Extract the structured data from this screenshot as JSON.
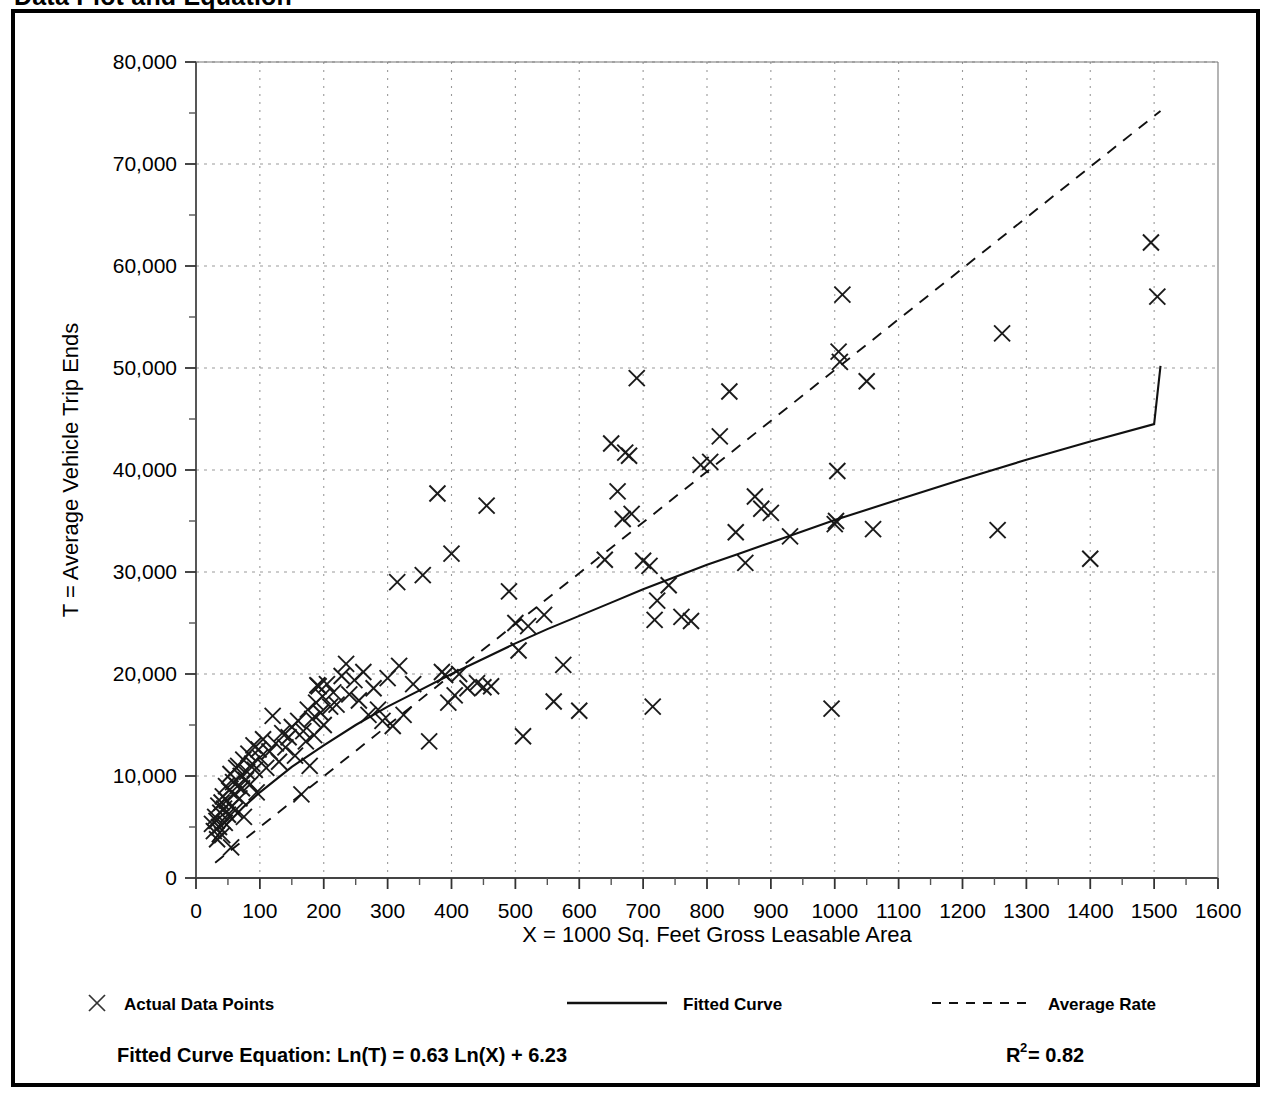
{
  "page": {
    "title": "Data Plot and Equation",
    "frame_color": "#000000",
    "background": "#ffffff"
  },
  "legend": {
    "position": "below-axis",
    "entries": [
      {
        "label": "Actual Data Points",
        "marker": "x-marker-icon",
        "style": "marker"
      },
      {
        "label": "Fitted Curve",
        "marker": "solid-line-icon",
        "style": "solid"
      },
      {
        "label": "Average Rate",
        "marker": "dashed-line-icon",
        "style": "dashed"
      }
    ]
  },
  "equation": {
    "fitted_label": "Fitted Curve Equation:  Ln(T) = 0.63 Ln(X) + 6.23",
    "r2_base": "R",
    "r2_sup": "2",
    "r2_value": " = 0.82"
  },
  "chart_data": {
    "type": "scatter",
    "title": "Data Plot and Equation",
    "xlabel": "X = 1000 Sq. Feet Gross Leasable Area",
    "ylabel": "T = Average Vehicle Trip Ends",
    "xlim": [
      0,
      1600
    ],
    "ylim": [
      0,
      80000
    ],
    "xticks": [
      0,
      100,
      200,
      300,
      400,
      500,
      600,
      700,
      800,
      900,
      1000,
      1100,
      1200,
      1300,
      1400,
      1500,
      1600
    ],
    "xticklabels": [
      "0",
      "100",
      "200",
      "300",
      "400",
      "500",
      "600",
      "700",
      "800",
      "900",
      "1000",
      "1100",
      "1200",
      "1300",
      "1400",
      "1500",
      "1600"
    ],
    "xminor_step": 50,
    "yticks": [
      0,
      10000,
      20000,
      30000,
      40000,
      50000,
      60000,
      70000,
      80000
    ],
    "yticklabels": [
      "0",
      "10,000",
      "20,000",
      "30,000",
      "40,000",
      "50,000",
      "60,000",
      "70,000",
      "80,000"
    ],
    "yminor_step": 5000,
    "grid": true,
    "grid_style": "dotted",
    "grid_color": "#999999",
    "axis_color": "#555555",
    "marker": "x",
    "marker_color": "#1a1a1a",
    "legend_position": "bottom",
    "series": [
      {
        "name": "Actual Data Points",
        "type": "scatter",
        "points": [
          [
            25,
            5300
          ],
          [
            28,
            4600
          ],
          [
            30,
            6000
          ],
          [
            32,
            5600
          ],
          [
            33,
            3800
          ],
          [
            35,
            7100
          ],
          [
            36,
            5000
          ],
          [
            38,
            6400
          ],
          [
            40,
            7400
          ],
          [
            41,
            4200
          ],
          [
            42,
            8000
          ],
          [
            44,
            6800
          ],
          [
            45,
            5400
          ],
          [
            47,
            9000
          ],
          [
            48,
            7600
          ],
          [
            50,
            6200
          ],
          [
            52,
            8600
          ],
          [
            54,
            10200
          ],
          [
            55,
            3000
          ],
          [
            56,
            7000
          ],
          [
            58,
            9400
          ],
          [
            60,
            8200
          ],
          [
            61,
            6600
          ],
          [
            63,
            10800
          ],
          [
            65,
            9000
          ],
          [
            66,
            11000
          ],
          [
            68,
            7800
          ],
          [
            70,
            10000
          ],
          [
            72,
            8800
          ],
          [
            74,
            11600
          ],
          [
            75,
            6000
          ],
          [
            78,
            9600
          ],
          [
            80,
            10400
          ],
          [
            82,
            12200
          ],
          [
            85,
            9200
          ],
          [
            88,
            11200
          ],
          [
            90,
            13000
          ],
          [
            92,
            10600
          ],
          [
            95,
            8400
          ],
          [
            98,
            12600
          ],
          [
            100,
            11800
          ],
          [
            105,
            13600
          ],
          [
            110,
            10800
          ],
          [
            115,
            12400
          ],
          [
            120,
            15900
          ],
          [
            125,
            13200
          ],
          [
            130,
            11400
          ],
          [
            135,
            14200
          ],
          [
            140,
            12800
          ],
          [
            145,
            13800
          ],
          [
            150,
            14800
          ],
          [
            155,
            12000
          ],
          [
            160,
            15400
          ],
          [
            165,
            8200
          ],
          [
            168,
            14400
          ],
          [
            172,
            13400
          ],
          [
            175,
            16500
          ],
          [
            178,
            11000
          ],
          [
            182,
            15600
          ],
          [
            185,
            14000
          ],
          [
            188,
            17200
          ],
          [
            190,
            18900
          ],
          [
            192,
            18800
          ],
          [
            195,
            16200
          ],
          [
            198,
            17800
          ],
          [
            200,
            15000
          ],
          [
            205,
            19000
          ],
          [
            210,
            16800
          ],
          [
            215,
            18200
          ],
          [
            220,
            17000
          ],
          [
            228,
            19800
          ],
          [
            235,
            21000
          ],
          [
            240,
            18000
          ],
          [
            248,
            19400
          ],
          [
            255,
            17400
          ],
          [
            262,
            20200
          ],
          [
            270,
            16000
          ],
          [
            278,
            18600
          ],
          [
            285,
            16500
          ],
          [
            292,
            15400
          ],
          [
            300,
            19600
          ],
          [
            308,
            14900
          ],
          [
            315,
            29000
          ],
          [
            318,
            20800
          ],
          [
            325,
            16000
          ],
          [
            340,
            19000
          ],
          [
            355,
            29700
          ],
          [
            365,
            13400
          ],
          [
            378,
            37700
          ],
          [
            385,
            20200
          ],
          [
            390,
            19900
          ],
          [
            395,
            17200
          ],
          [
            400,
            31800
          ],
          [
            405,
            17900
          ],
          [
            412,
            20000
          ],
          [
            425,
            18600
          ],
          [
            440,
            19100
          ],
          [
            450,
            18700
          ],
          [
            455,
            36500
          ],
          [
            462,
            18800
          ],
          [
            490,
            28100
          ],
          [
            500,
            25000
          ],
          [
            505,
            22300
          ],
          [
            512,
            13900
          ],
          [
            520,
            24700
          ],
          [
            545,
            25800
          ],
          [
            560,
            17300
          ],
          [
            575,
            20900
          ],
          [
            600,
            16400
          ],
          [
            640,
            31200
          ],
          [
            650,
            42600
          ],
          [
            660,
            37900
          ],
          [
            668,
            35200
          ],
          [
            672,
            41700
          ],
          [
            678,
            41400
          ],
          [
            682,
            35700
          ],
          [
            690,
            49000
          ],
          [
            700,
            31100
          ],
          [
            710,
            30600
          ],
          [
            715,
            16800
          ],
          [
            718,
            25300
          ],
          [
            722,
            27200
          ],
          [
            740,
            28700
          ],
          [
            760,
            25600
          ],
          [
            775,
            25200
          ],
          [
            790,
            40500
          ],
          [
            805,
            40800
          ],
          [
            820,
            43300
          ],
          [
            835,
            47700
          ],
          [
            845,
            33900
          ],
          [
            860,
            30900
          ],
          [
            875,
            37400
          ],
          [
            885,
            36200
          ],
          [
            900,
            35800
          ],
          [
            930,
            33500
          ],
          [
            995,
            16600
          ],
          [
            1000,
            34700
          ],
          [
            1002,
            35000
          ],
          [
            1004,
            39900
          ],
          [
            1006,
            51600
          ],
          [
            1008,
            50600
          ],
          [
            1012,
            57200
          ],
          [
            1050,
            48700
          ],
          [
            1060,
            34200
          ],
          [
            1255,
            34100
          ],
          [
            1262,
            53400
          ],
          [
            1400,
            31300
          ],
          [
            1495,
            62300
          ],
          [
            1505,
            57000
          ]
        ]
      },
      {
        "name": "Fitted Curve",
        "type": "line",
        "style": "solid",
        "equation": "Ln(T) = 0.63 Ln(X) + 6.23",
        "points": [
          [
            25,
            3500
          ],
          [
            50,
            5400
          ],
          [
            75,
            7000
          ],
          [
            100,
            8400
          ],
          [
            150,
            10900
          ],
          [
            200,
            13000
          ],
          [
            250,
            15000
          ],
          [
            300,
            16800
          ],
          [
            350,
            18400
          ],
          [
            400,
            20000
          ],
          [
            450,
            21500
          ],
          [
            500,
            23000
          ],
          [
            550,
            24400
          ],
          [
            600,
            25700
          ],
          [
            650,
            27000
          ],
          [
            700,
            28300
          ],
          [
            750,
            29500
          ],
          [
            800,
            30700
          ],
          [
            850,
            31800
          ],
          [
            900,
            32900
          ],
          [
            950,
            34000
          ],
          [
            1000,
            35100
          ],
          [
            1100,
            37100
          ],
          [
            1200,
            39100
          ],
          [
            1300,
            41000
          ],
          [
            1400,
            42800
          ],
          [
            1500,
            44500
          ],
          [
            1510,
            50200
          ]
        ]
      },
      {
        "name": "Average Rate",
        "type": "line",
        "style": "dashed",
        "points": [
          [
            30,
            1500
          ],
          [
            1510,
            75200
          ]
        ]
      }
    ]
  }
}
